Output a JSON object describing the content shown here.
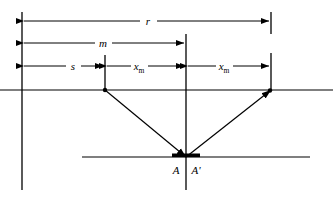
{
  "figure": {
    "type": "geometric-optics-ray-diagram",
    "background_color": "#ffffff",
    "line_color": "#000000"
  },
  "dimensions": [
    {
      "id": "r",
      "label": "r",
      "row_y": 21,
      "from_x": 22,
      "to_x": 271,
      "label_x": 148
    },
    {
      "id": "m",
      "label": "m",
      "row_y": 43,
      "from_x": 22,
      "to_x": 186,
      "label_x": 103
    },
    {
      "id": "s",
      "label": "s",
      "row_y": 66,
      "from_x": 22,
      "to_x": 105,
      "label_x": 73
    },
    {
      "id": "xm-left",
      "label": "x",
      "subscript": "m",
      "row_y": 66,
      "from_x": 105,
      "to_x": 186,
      "label_x": 139
    },
    {
      "id": "xm-right",
      "label": "x",
      "subscript": "m",
      "row_y": 66,
      "from_x": 186,
      "to_x": 271,
      "label_x": 224
    }
  ],
  "verticals": [
    {
      "id": "left-datum",
      "x": 22,
      "y1": 12,
      "y2": 190
    },
    {
      "id": "tick-s",
      "x": 105,
      "y1": 55,
      "y2": 91
    },
    {
      "id": "center-axis",
      "x": 186,
      "y1": 34,
      "y2": 190
    },
    {
      "id": "right-datum-upper",
      "x": 271,
      "y1": 12,
      "y2": 34
    },
    {
      "id": "right-datum-lower",
      "x": 271,
      "y1": 53,
      "y2": 91
    }
  ],
  "horizontals": [
    {
      "id": "surface-line",
      "y": 90,
      "x1": 0,
      "x2": 333
    },
    {
      "id": "focal-line",
      "y": 157,
      "x1": 82,
      "x2": 310
    }
  ],
  "rays": [
    {
      "id": "incident-ray",
      "from_x": 105,
      "from_y": 90,
      "to_x": 186,
      "to_y": 157,
      "arrow_at": "end",
      "source_dot": true
    },
    {
      "id": "reflected-ray",
      "from_x": 186,
      "from_y": 157,
      "to_x": 271,
      "to_y": 90,
      "arrow_at": "end",
      "source_dot": false
    }
  ],
  "marker_bar": {
    "id": "aperture-bar",
    "center_x": 186,
    "y": 155,
    "half_width": 14,
    "thickness": 4
  },
  "point_labels": [
    {
      "id": "A",
      "label": "A",
      "x": 176,
      "y": 173
    },
    {
      "id": "Aprime",
      "label": "A'",
      "x": 194,
      "y": 173
    }
  ]
}
